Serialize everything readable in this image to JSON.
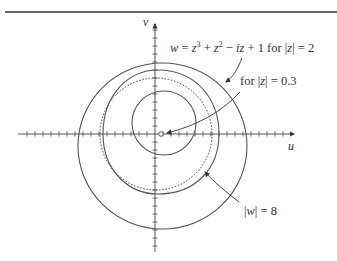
{
  "figure": {
    "top_rule": true,
    "axes": {
      "horizontal_label": "u",
      "vertical_label": "v",
      "origin_px": [
        155,
        134
      ],
      "tick_spacing_px": 8
    },
    "curves": [
      {
        "name": "image-of-|z|=2-outer-loop",
        "style": "solid",
        "description": "outer loop of w for |z|=2"
      },
      {
        "name": "image-of-|z|=2-inner-loop",
        "style": "solid",
        "description": "inner loop of w for |z|=2"
      },
      {
        "name": "circle-|w|=8",
        "style": "dotted",
        "description": "|w| = 8 reference circle"
      },
      {
        "name": "image-of-|z|=0.3",
        "style": "solid",
        "description": "small curve near w=1"
      }
    ],
    "labels": {
      "main_equation": "w = z³ + z² − iz + 1 for |z| = 2",
      "eq_w": "w",
      "eq_eq": " = ",
      "eq_z1": "z",
      "eq_sup3": "3",
      "eq_plus1": " + ",
      "eq_z2": "z",
      "eq_sup2": "2",
      "eq_minus": " − ",
      "eq_iz": "iz",
      "eq_tail": " + 1 for |",
      "eq_z3": "z",
      "eq_end": "| = 2",
      "small_label": "for |z| = 0.3",
      "small_pre": "for |",
      "small_z": "z",
      "small_post": "| = 0.3",
      "circle_label": "|w| = 8",
      "circle_pre": "|",
      "circle_w": "w",
      "circle_post": "| = 8"
    },
    "colors": {
      "curve": "#555555",
      "axis": "#444444",
      "text": "#333333"
    }
  }
}
